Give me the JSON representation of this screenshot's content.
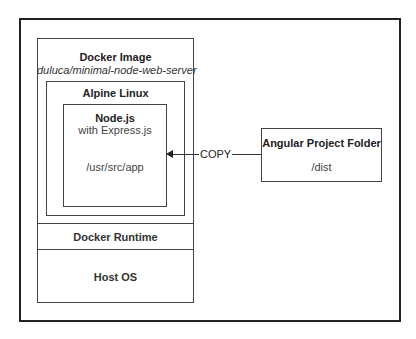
{
  "diagram": {
    "docker_image": {
      "title": "Docker Image",
      "subtitle": "duluca/minimal-node-web-server"
    },
    "alpine": {
      "title": "Alpine Linux"
    },
    "node": {
      "title": "Node.js",
      "subtitle": "with Express.js",
      "path": "/usr/src/app"
    },
    "runtime": {
      "title": "Docker Runtime"
    },
    "host": {
      "title": "Host OS"
    },
    "angular": {
      "title": "Angular Project Folder",
      "path": "/dist"
    },
    "edge": {
      "label": "COPY",
      "from": "angular",
      "to": "node"
    }
  }
}
